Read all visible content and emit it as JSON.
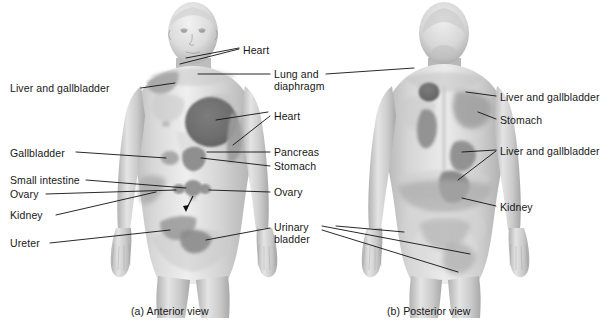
{
  "figure": {
    "title_visible": false,
    "background_color": "#ffffff",
    "line_color": "#111111",
    "text_color": "#171717"
  },
  "captions": [
    {
      "id": "anterior",
      "text": "(a) Anterior view",
      "x": 131,
      "y": 311
    },
    {
      "id": "posterior",
      "text": "(b) Posterior view",
      "x": 387,
      "y": 311
    }
  ],
  "labels_left": [
    {
      "id": "liver-gallbladder-ant",
      "text": "Liver and gallbladder",
      "x": 10,
      "y": 82
    },
    {
      "id": "gallbladder-ant",
      "text": "Gallbladder",
      "x": 10,
      "y": 150
    },
    {
      "id": "small-intestine-ant",
      "text": "Small intestine",
      "x": 10,
      "y": 177
    },
    {
      "id": "ovary-left-ant",
      "text": "Ovary",
      "x": 10,
      "y": 191
    },
    {
      "id": "kidney-ant",
      "text": "Kidney",
      "x": 10,
      "y": 212
    },
    {
      "id": "ureter-ant",
      "text": "Ureter",
      "x": 10,
      "y": 240
    }
  ],
  "labels_middle": [
    {
      "id": "heart-neck",
      "text": "Heart",
      "x": 243,
      "y": 44
    },
    {
      "id": "lung-diaphragm",
      "text": "Lung and\ndiaphragm",
      "x": 274,
      "y": 68
    },
    {
      "id": "heart-chest",
      "text": "Heart",
      "x": 274,
      "y": 110
    },
    {
      "id": "pancreas",
      "text": "Pancreas",
      "x": 274,
      "y": 147
    },
    {
      "id": "stomach-ant",
      "text": "Stomach",
      "x": 274,
      "y": 163
    },
    {
      "id": "ovary-right-ant",
      "text": "Ovary",
      "x": 274,
      "y": 188
    },
    {
      "id": "urinary-bladder",
      "text": "Urinary\nbladder",
      "x": 274,
      "y": 221
    }
  ],
  "labels_right": [
    {
      "id": "liver-gallbladder-post-upper",
      "text": "Liver and gallbladder",
      "x": 500,
      "y": 91
    },
    {
      "id": "stomach-post",
      "text": "Stomach",
      "x": 500,
      "y": 114
    },
    {
      "id": "liver-gallbladder-post-lower",
      "text": "Liver and gallbladder",
      "x": 500,
      "y": 145
    },
    {
      "id": "kidney-post",
      "text": "Kidney",
      "x": 500,
      "y": 201
    }
  ],
  "organ_regions": {
    "anterior": [
      {
        "name": "liver-and-gallbladder-shoulder",
        "shade": "#a9a9a9"
      },
      {
        "name": "heart-chest-patch",
        "shade": "#6e6e6e"
      },
      {
        "name": "lung-and-diaphragm-flank",
        "shade": "#9d9d9d"
      },
      {
        "name": "pancreas-epigastric",
        "shade": "#8c8c8c"
      },
      {
        "name": "stomach-epigastric",
        "shade": "#8c8c8c"
      },
      {
        "name": "gallbladder-right-upper-quadrant",
        "shade": "#a0a0a0"
      },
      {
        "name": "small-intestine-periumbilical",
        "shade": "#8f8f8f"
      },
      {
        "name": "ovary-left-lower-quadrant",
        "shade": "#8f8f8f"
      },
      {
        "name": "ovary-right-lower-quadrant",
        "shade": "#8f8f8f"
      },
      {
        "name": "kidney-flank",
        "shade": "#adadad"
      },
      {
        "name": "ureter-groin",
        "shade": "#9a9a9a"
      },
      {
        "name": "urinary-bladder-suprapubic",
        "shade": "#8a8a8a"
      }
    ],
    "posterior": [
      {
        "name": "liver-and-gallbladder-scapula",
        "shade": "#707070"
      },
      {
        "name": "stomach-upper-back",
        "shade": "#9e9e9e"
      },
      {
        "name": "liver-and-gallbladder-mid-back",
        "shade": "#8b8b8b"
      },
      {
        "name": "liver-and-gallbladder-lower-back",
        "shade": "#8b8b8b"
      },
      {
        "name": "kidney-lumbar",
        "shade": "#a8a8a8"
      },
      {
        "name": "urinary-bladder-sacral",
        "shade": "#b4b4b4"
      },
      {
        "name": "urinary-bladder-gluteal",
        "shade": "#b0b0b0"
      }
    ]
  },
  "icons": {
    "arrow": "arrow-icon",
    "leader_line": "leader-line-icon"
  }
}
